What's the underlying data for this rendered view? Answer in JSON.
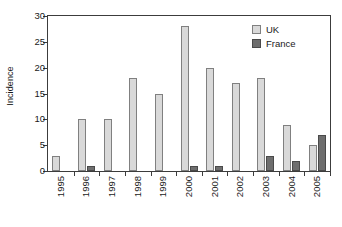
{
  "chart_data": {
    "type": "bar",
    "title": "",
    "subtitle": "",
    "xlabel": "",
    "ylabel": "Incidence",
    "categories": [
      "1995",
      "1996",
      "1997",
      "1998",
      "1999",
      "2000",
      "2001",
      "2002",
      "2003",
      "2004",
      "2005"
    ],
    "series": [
      {
        "name": "UK",
        "color": "#d9d9d9",
        "values": [
          3,
          10,
          10,
          18,
          15,
          28,
          20,
          17,
          18,
          9,
          5
        ]
      },
      {
        "name": "France",
        "color": "#6e6e6e",
        "values": [
          0,
          1,
          0,
          0,
          0,
          1,
          1,
          0,
          3,
          2,
          7
        ]
      }
    ],
    "ylim": [
      0,
      30
    ],
    "yticks": [
      0,
      5,
      10,
      15,
      20,
      25,
      30
    ],
    "ytick_labels": [
      "0",
      "5",
      "10",
      "15",
      "20",
      "25",
      "30"
    ],
    "grid": false,
    "legend_position": "top-right",
    "xtick_rotation": 90,
    "annotations": []
  },
  "legend": {
    "entries": [
      {
        "label": "UK",
        "swatch": "uk-swatch"
      },
      {
        "label": "France",
        "swatch": "france-swatch"
      }
    ]
  },
  "axes": {
    "y_title": "Incidence"
  }
}
